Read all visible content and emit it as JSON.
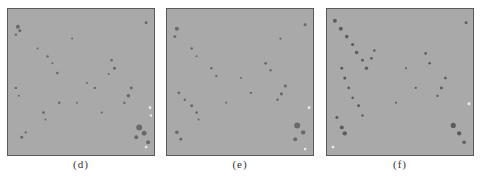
{
  "figure": {
    "panels": [
      {
        "id": "d",
        "label": "(d)",
        "background": "#a9a9a9"
      },
      {
        "id": "e",
        "label": "(e)",
        "background": "#a9a9a9"
      },
      {
        "id": "f",
        "label": "(f)",
        "background": "#a9a9a9"
      }
    ]
  }
}
